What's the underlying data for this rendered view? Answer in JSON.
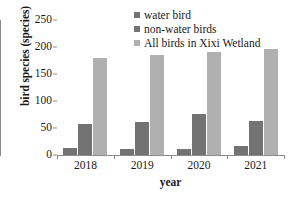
{
  "chart_data": {
    "type": "bar",
    "title": "",
    "xlabel": "year",
    "ylabel": "bird species (species)",
    "categories": [
      "2018",
      "2019",
      "2020",
      "2021"
    ],
    "ylim": [
      0,
      250
    ],
    "yticks": [
      0,
      50,
      100,
      150,
      200,
      250
    ],
    "ytick_labels": [
      "0",
      "50",
      "100",
      "150",
      "200",
      "250"
    ],
    "grid": false,
    "legend_position": "top-right-inside",
    "series": [
      {
        "name": "water bird",
        "color": "#737373",
        "values": [
          13,
          11,
          11,
          17
        ]
      },
      {
        "name": "non-water birds",
        "color": "#737373",
        "values": [
          57,
          62,
          76,
          63
        ]
      },
      {
        "name": "All birds in Xixi Wetland",
        "color": "#b0b0b0",
        "values": [
          180,
          185,
          190,
          197
        ]
      }
    ]
  },
  "legend": {
    "items": [
      {
        "label": "water bird"
      },
      {
        "label": "non-water birds"
      },
      {
        "label": "All birds in Xixi Wetland"
      }
    ]
  },
  "axes": {
    "y_title": "bird species (species)",
    "x_title": "year"
  }
}
